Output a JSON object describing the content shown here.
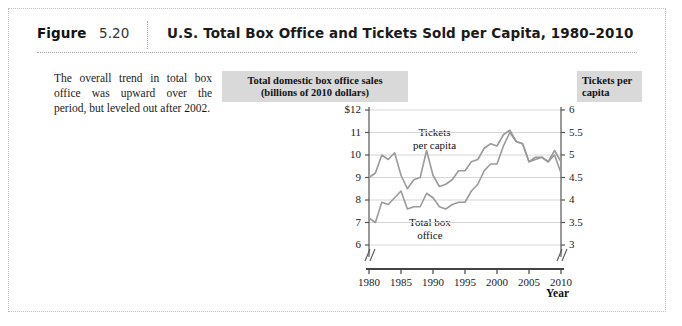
{
  "figure": {
    "label": "Figure",
    "number": "5.20",
    "title": "U.S. Total Box Office and Tickets Sold per Capita, 1980–2010",
    "caption": "The overall trend in total box office was upward over the period, but leveled out after 2002."
  },
  "left_axis_box": "Total domestic box office sales (billions of 2010 dollars)",
  "left_axis_box_line1": "Total domestic box office sales",
  "left_axis_box_line2": "(billions of 2010 dollars)",
  "right_axis_box_line1": "Tickets per",
  "right_axis_box_line2": "capita",
  "annotations": {
    "tickets_line1": "Tickets",
    "tickets_line2": "per capita",
    "boxoffice_line1": "Total box",
    "boxoffice_line2": "office"
  },
  "colors": {
    "line": "#9a9a9a",
    "axis": "#555555",
    "grid": "#d6d6d6",
    "box_bg": "#d9d9d9",
    "frame": "#bdbdbd"
  },
  "chart_data": {
    "type": "line",
    "title": "U.S. Total Box Office and Tickets Sold per Capita, 1980–2010",
    "xlabel": "Year",
    "ylabel": "Total domestic box office sales (billions of 2010 dollars)",
    "y2label": "Tickets per capita",
    "xlim": [
      1980,
      2010
    ],
    "ylim": [
      6,
      12
    ],
    "y2lim": [
      3,
      6
    ],
    "grid": true,
    "legend": "inline-annotations",
    "axis_break": true,
    "x": [
      1980,
      1981,
      1982,
      1983,
      1984,
      1985,
      1986,
      1987,
      1988,
      1989,
      1990,
      1991,
      1992,
      1993,
      1994,
      1995,
      1996,
      1997,
      1998,
      1999,
      2000,
      2001,
      2002,
      2003,
      2004,
      2005,
      2006,
      2007,
      2008,
      2009,
      2010
    ],
    "yticks": [
      "$12",
      "11",
      "10",
      "9",
      "8",
      "7",
      "6"
    ],
    "ytick_values": [
      12,
      11,
      10,
      9,
      8,
      7,
      6
    ],
    "y2ticks": [
      "6",
      "5.5",
      "5",
      "4.5",
      "4",
      "3.5",
      "3"
    ],
    "y2tick_values": [
      6,
      5.5,
      5,
      4.5,
      4,
      3.5,
      3
    ],
    "xticks": [
      "1980",
      "1985",
      "1990",
      "1995",
      "2000",
      "2005",
      "2010"
    ],
    "xtick_values": [
      1980,
      1985,
      1990,
      1995,
      2000,
      2005,
      2010
    ],
    "series": [
      {
        "name": "Tickets per capita",
        "axis": "right",
        "units": "tickets per capita",
        "values": [
          4.5,
          4.6,
          5.0,
          4.9,
          5.0,
          4.55,
          4.3,
          4.45,
          4.5,
          4.95,
          4.55,
          4.3,
          4.35,
          4.45,
          4.6,
          4.65,
          4.85,
          4.9,
          5.1,
          5.2,
          5.2,
          5.45,
          5.55,
          5.3,
          5.25,
          4.85,
          4.95,
          4.95,
          4.85,
          5.0,
          4.6
        ],
        "values_plot_scale": [
          9.0,
          9.2,
          10.0,
          9.8,
          10.1,
          9.1,
          8.5,
          8.9,
          9.0,
          10.2,
          9.1,
          8.6,
          8.7,
          8.9,
          9.3,
          9.3,
          9.7,
          9.8,
          10.3,
          10.5,
          10.4,
          10.9,
          11.1,
          10.6,
          10.5,
          9.7,
          9.9,
          9.9,
          9.7,
          10.0,
          9.2
        ]
      },
      {
        "name": "Total box office",
        "axis": "left",
        "units": "billions of 2010 dollars",
        "values": [
          7.2,
          7.0,
          7.9,
          7.8,
          8.1,
          8.4,
          7.6,
          7.7,
          7.7,
          8.3,
          8.1,
          7.7,
          7.6,
          7.8,
          7.9,
          7.9,
          8.4,
          8.7,
          9.3,
          9.6,
          9.6,
          10.4,
          11.0,
          10.6,
          10.5,
          9.7,
          9.8,
          9.9,
          9.7,
          10.2,
          9.7
        ],
        "values_plot_scale": [
          7.2,
          7.0,
          7.9,
          7.8,
          8.1,
          8.4,
          7.6,
          7.7,
          7.7,
          8.3,
          8.1,
          7.7,
          7.6,
          7.8,
          7.9,
          7.9,
          8.4,
          8.7,
          9.3,
          9.6,
          9.6,
          10.4,
          11.0,
          10.6,
          10.5,
          9.7,
          9.8,
          9.9,
          9.7,
          10.2,
          9.7
        ]
      }
    ]
  }
}
